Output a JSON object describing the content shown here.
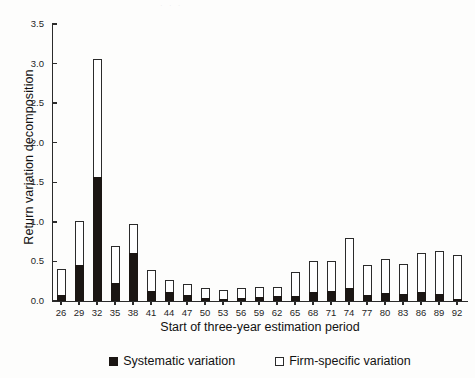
{
  "figure": {
    "scan_artifact": "· ·  ·",
    "legend": [
      {
        "marker": "filled-square-icon",
        "label": "Systematic variation"
      },
      {
        "marker": "hollow-square-icon",
        "label": "Firm-specific variation"
      }
    ]
  },
  "chart_data": {
    "type": "bar",
    "stacked": true,
    "title": "",
    "xlabel": "Start of three-year estimation period",
    "ylabel": "Return variation decomposition",
    "ylim": [
      0.0,
      3.5
    ],
    "yticks": [
      "0.0",
      "0.5",
      "1.0",
      "1.5",
      "2.0",
      "2.5",
      "3.0",
      "3.5"
    ],
    "ytick_values": [
      0.0,
      0.5,
      1.0,
      1.5,
      2.0,
      2.5,
      3.0,
      3.5
    ],
    "grid": false,
    "legend_position": "bottom-center",
    "categories": [
      "26",
      "29",
      "32",
      "35",
      "38",
      "41",
      "44",
      "47",
      "50",
      "53",
      "56",
      "59",
      "62",
      "65",
      "68",
      "71",
      "74",
      "77",
      "80",
      "83",
      "86",
      "89",
      "92"
    ],
    "series": [
      {
        "name": "Systematic variation",
        "color": "#1b1613",
        "values": [
          0.08,
          0.45,
          1.57,
          0.23,
          0.61,
          0.13,
          0.11,
          0.07,
          0.04,
          0.03,
          0.04,
          0.05,
          0.06,
          0.06,
          0.11,
          0.13,
          0.17,
          0.08,
          0.1,
          0.09,
          0.11,
          0.09,
          0.02
        ]
      },
      {
        "name": "Firm-specific variation",
        "color": "#ffffff",
        "values": [
          0.32,
          0.56,
          1.49,
          0.47,
          0.36,
          0.26,
          0.16,
          0.14,
          0.12,
          0.11,
          0.12,
          0.13,
          0.12,
          0.31,
          0.4,
          0.37,
          0.62,
          0.38,
          0.43,
          0.38,
          0.5,
          0.54,
          0.56
        ]
      }
    ],
    "totals": [
      0.4,
      1.01,
      3.06,
      0.7,
      0.97,
      0.39,
      0.27,
      0.21,
      0.16,
      0.14,
      0.16,
      0.18,
      0.18,
      0.37,
      0.51,
      0.5,
      0.79,
      0.46,
      0.53,
      0.47,
      0.61,
      0.63,
      0.58
    ]
  }
}
